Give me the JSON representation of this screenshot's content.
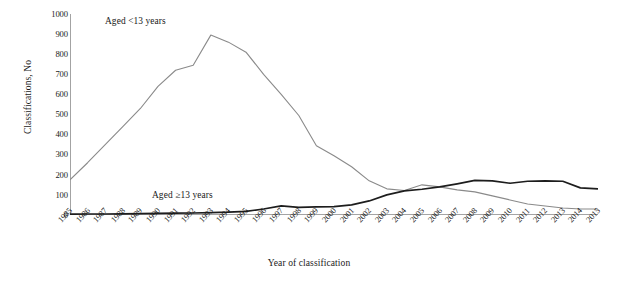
{
  "chart_data": {
    "type": "line",
    "title": "",
    "xlabel": "Year of classification",
    "ylabel": "Classifications, No",
    "ylim": [
      0,
      1000
    ],
    "ytick_step": 100,
    "yticks": [
      "1000",
      "900",
      "800",
      "700",
      "600",
      "500",
      "400",
      "300",
      "200",
      "100",
      "0"
    ],
    "grid": false,
    "legend_position": "inline-annotations",
    "categories": [
      "1985",
      "1986",
      "1987",
      "1988",
      "1989",
      "1990",
      "1991",
      "1992",
      "1993",
      "1994",
      "1995",
      "1996",
      "1997",
      "1998",
      "1999",
      "2000",
      "2001",
      "2002",
      "2003",
      "2004",
      "2005",
      "2006",
      "2007",
      "2008",
      "2009",
      "2010",
      "2011",
      "2012",
      "2013",
      "2014",
      "2015"
    ],
    "series": [
      {
        "name": "Aged <13 years",
        "color": "#8a8a8a",
        "values": [
          175,
          260,
          350,
          440,
          530,
          640,
          720,
          745,
          895,
          860,
          810,
          700,
          600,
          495,
          345,
          295,
          240,
          170,
          130,
          122,
          150,
          140,
          125,
          115,
          95,
          75,
          55,
          45,
          35,
          30,
          30
        ]
      },
      {
        "name": "Aged ≥13 years",
        "color": "#1d1d1d",
        "values": [
          4,
          5,
          5,
          6,
          7,
          8,
          9,
          10,
          12,
          14,
          18,
          30,
          45,
          38,
          40,
          42,
          50,
          70,
          100,
          120,
          128,
          140,
          155,
          172,
          170,
          158,
          168,
          170,
          168,
          135,
          130
        ]
      }
    ],
    "annotations": [
      {
        "text": "Aged <13 years",
        "series": "Aged <13 years"
      },
      {
        "text": "Aged ≥13 years",
        "series": "Aged ≥13 years"
      }
    ]
  },
  "axis": {
    "y_title": "Classifications, No",
    "x_title": "Year of classification"
  }
}
